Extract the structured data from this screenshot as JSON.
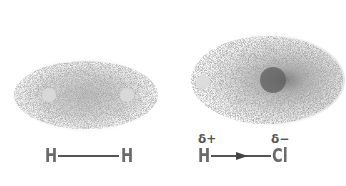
{
  "diagram": {
    "left": {
      "molecule": "H2",
      "bond_type": "nonpolar covalent",
      "atom_a": "H",
      "atom_b": "H",
      "bond": "—"
    },
    "right": {
      "molecule": "HCl",
      "bond_type": "polar covalent",
      "atom_a": "H",
      "atom_b": "Cl",
      "partial_a": "δ+",
      "partial_b": "δ−",
      "bond": "→"
    },
    "colors": {
      "cloud": "#6e6e6e",
      "nucleus": "#d8d8d8",
      "text": "#6a6a6a",
      "background": "#ffffff"
    }
  }
}
